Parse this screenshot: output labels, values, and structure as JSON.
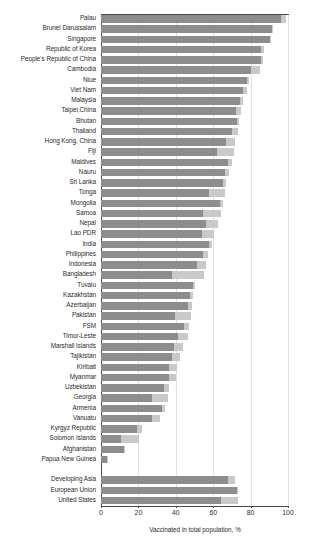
{
  "chart_data": {
    "type": "bar",
    "orientation": "horizontal",
    "stacked": true,
    "title": "",
    "subtitle": "",
    "xlabel": "Vaccinated in total population, %",
    "ylabel": "",
    "xlim": [
      0,
      100
    ],
    "xticks": [
      0,
      20,
      40,
      60,
      80,
      100
    ],
    "xtick_labels": [
      "0",
      "20",
      "40",
      "60",
      "80",
      "100"
    ],
    "grid": "vertical",
    "legend": "none",
    "colors": {
      "fully_vaccinated": "#8d8d8d",
      "partially_vaccinated": "#c9c9c9",
      "axis": "#4a4a4a",
      "gridline": "#e2e2e2",
      "background": "#ffffff"
    },
    "series": [
      {
        "name": "Fully vaccinated",
        "color": "#8d8d8d"
      },
      {
        "name": "Partially vaccinated",
        "color": "#c9c9c9"
      }
    ],
    "categories": [
      "Palau",
      "Brunei Darussalam",
      "Singapore",
      "Republic of Korea",
      "People's Republic of China",
      "Cambodia",
      "Niue",
      "Viet Nam",
      "Malaysia",
      "Taipei,China",
      "Bhutan",
      "Thailand",
      "Hong Kong, China",
      "Fiji",
      "Maldives",
      "Nauru",
      "Sri Lanka",
      "Tonga",
      "Mongolia",
      "Samoa",
      "Nepal",
      "Lao PDR",
      "India",
      "Philippines",
      "Indonesia",
      "Bangladesh",
      "Tuvalu",
      "Kazakhstan",
      "Azerbaijan",
      "Pakistan",
      "FSM",
      "Timor-Leste",
      "Marshall Islands",
      "Tajikistan",
      "Kiribati",
      "Myanmar",
      "Uzbekistan",
      "Georgia",
      "Armenia",
      "Vanuatu",
      "Kyrgyz Republic",
      "Solomon Islands",
      "Afghanistan",
      "Papua New Guinea",
      "Developing Asia",
      "European Union",
      "United States"
    ],
    "rows": [
      {
        "label": "Palau",
        "fully": 96.0,
        "partial": 3.0,
        "total": 99.0,
        "group": "economy"
      },
      {
        "label": "Brunei Darussalam",
        "fully": 91.5,
        "partial": 0.5,
        "total": 92.0,
        "group": "economy"
      },
      {
        "label": "Singapore",
        "fully": 90.5,
        "partial": 0.5,
        "total": 91.0,
        "group": "economy"
      },
      {
        "label": "Republic of Korea",
        "fully": 85.5,
        "partial": 1.5,
        "total": 87.0,
        "group": "economy"
      },
      {
        "label": "People's Republic of China",
        "fully": 85.5,
        "partial": 1.0,
        "total": 86.5,
        "group": "economy"
      },
      {
        "label": "Cambodia",
        "fully": 80.0,
        "partial": 5.0,
        "total": 85.0,
        "group": "economy"
      },
      {
        "label": "Niue",
        "fully": 78.0,
        "partial": 1.0,
        "total": 79.0,
        "group": "economy"
      },
      {
        "label": "Viet Nam",
        "fully": 76.0,
        "partial": 2.0,
        "total": 78.0,
        "group": "economy"
      },
      {
        "label": "Malaysia",
        "fully": 74.5,
        "partial": 1.5,
        "total": 76.0,
        "group": "economy"
      },
      {
        "label": "Taipei,China",
        "fully": 72.0,
        "partial": 3.0,
        "total": 75.0,
        "group": "economy"
      },
      {
        "label": "Bhutan",
        "fully": 72.5,
        "partial": 1.5,
        "total": 74.0,
        "group": "economy"
      },
      {
        "label": "Thailand",
        "fully": 70.0,
        "partial": 3.0,
        "total": 73.0,
        "group": "economy"
      },
      {
        "label": "Hong Kong, China",
        "fully": 67.0,
        "partial": 4.5,
        "total": 71.5,
        "group": "economy"
      },
      {
        "label": "Fiji",
        "fully": 62.0,
        "partial": 9.0,
        "total": 71.0,
        "group": "economy"
      },
      {
        "label": "Maldives",
        "fully": 68.0,
        "partial": 2.0,
        "total": 70.0,
        "group": "economy"
      },
      {
        "label": "Nauru",
        "fully": 66.5,
        "partial": 2.0,
        "total": 68.5,
        "group": "economy"
      },
      {
        "label": "Sri Lanka",
        "fully": 65.5,
        "partial": 1.5,
        "total": 67.0,
        "group": "economy"
      },
      {
        "label": "Tonga",
        "fully": 58.0,
        "partial": 8.5,
        "total": 66.5,
        "group": "economy"
      },
      {
        "label": "Mongolia",
        "fully": 63.5,
        "partial": 1.5,
        "total": 65.0,
        "group": "economy"
      },
      {
        "label": "Samoa",
        "fully": 54.5,
        "partial": 9.5,
        "total": 64.0,
        "group": "economy"
      },
      {
        "label": "Nepal",
        "fully": 56.0,
        "partial": 6.5,
        "total": 62.5,
        "group": "economy"
      },
      {
        "label": "Lao PDR",
        "fully": 54.0,
        "partial": 6.5,
        "total": 60.5,
        "group": "economy"
      },
      {
        "label": "India",
        "fully": 57.5,
        "partial": 2.0,
        "total": 59.5,
        "group": "economy"
      },
      {
        "label": "Philippines",
        "fully": 54.5,
        "partial": 2.5,
        "total": 57.0,
        "group": "economy"
      },
      {
        "label": "Indonesia",
        "fully": 51.5,
        "partial": 4.5,
        "total": 56.0,
        "group": "economy"
      },
      {
        "label": "Bangladesh",
        "fully": 38.0,
        "partial": 17.0,
        "total": 55.0,
        "group": "economy"
      },
      {
        "label": "Tuvalu",
        "fully": 49.0,
        "partial": 1.5,
        "total": 50.5,
        "group": "economy"
      },
      {
        "label": "Kazakhstan",
        "fully": 47.5,
        "partial": 1.5,
        "total": 49.0,
        "group": "economy"
      },
      {
        "label": "Azerbaijan",
        "fully": 46.5,
        "partial": 2.0,
        "total": 48.5,
        "group": "economy"
      },
      {
        "label": "Pakistan",
        "fully": 39.5,
        "partial": 8.5,
        "total": 48.0,
        "group": "economy"
      },
      {
        "label": "FSM",
        "fully": 44.5,
        "partial": 2.5,
        "total": 47.0,
        "group": "economy"
      },
      {
        "label": "Timor-Leste",
        "fully": 41.0,
        "partial": 5.5,
        "total": 46.5,
        "group": "economy"
      },
      {
        "label": "Marshall Islands",
        "fully": 39.0,
        "partial": 5.0,
        "total": 44.0,
        "group": "economy"
      },
      {
        "label": "Tajikistan",
        "fully": 38.0,
        "partial": 4.5,
        "total": 42.5,
        "group": "economy"
      },
      {
        "label": "Kiribati",
        "fully": 36.5,
        "partial": 4.0,
        "total": 40.5,
        "group": "economy"
      },
      {
        "label": "Myanmar",
        "fully": 36.5,
        "partial": 3.5,
        "total": 40.0,
        "group": "economy"
      },
      {
        "label": "Uzbekistan",
        "fully": 33.5,
        "partial": 3.0,
        "total": 36.5,
        "group": "economy"
      },
      {
        "label": "Georgia",
        "fully": 27.5,
        "partial": 8.5,
        "total": 36.0,
        "group": "economy"
      },
      {
        "label": "Armenia",
        "fully": 32.5,
        "partial": 1.5,
        "total": 34.0,
        "group": "economy"
      },
      {
        "label": "Vanuatu",
        "fully": 27.5,
        "partial": 4.0,
        "total": 31.5,
        "group": "economy"
      },
      {
        "label": "Kyrgyz Republic",
        "fully": 19.0,
        "partial": 3.0,
        "total": 22.0,
        "group": "economy"
      },
      {
        "label": "Solomon Islands",
        "fully": 10.5,
        "partial": 10.0,
        "total": 20.5,
        "group": "economy"
      },
      {
        "label": "Afghanistan",
        "fully": 12.5,
        "partial": 0.5,
        "total": 13.0,
        "group": "economy"
      },
      {
        "label": "Papua New Guinea",
        "fully": 3.0,
        "partial": 0.5,
        "total": 3.5,
        "group": "economy"
      },
      {
        "label": "",
        "fully": 0,
        "partial": 0,
        "total": 0,
        "group": "spacer"
      },
      {
        "label": "Developing Asia",
        "fully": 68.0,
        "partial": 3.5,
        "total": 71.5,
        "group": "aggregate"
      },
      {
        "label": "European Union",
        "fully": 72.5,
        "partial": 0.5,
        "total": 73.0,
        "group": "aggregate"
      },
      {
        "label": "United States",
        "fully": 64.0,
        "partial": 9.5,
        "total": 73.5,
        "group": "aggregate"
      }
    ]
  }
}
